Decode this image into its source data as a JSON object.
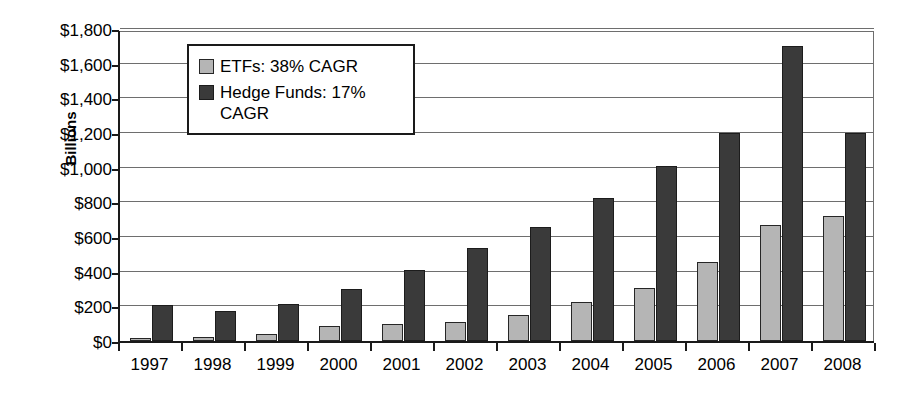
{
  "chart_data": {
    "type": "bar",
    "title": "",
    "xlabel": "",
    "ylabel": "Billions",
    "ylim": [
      0,
      1800
    ],
    "ytick_step": 200,
    "grid": true,
    "legend_position": "upper-left-inside",
    "categories": [
      "1997",
      "1998",
      "1999",
      "2000",
      "2001",
      "2002",
      "2003",
      "2004",
      "2005",
      "2006",
      "2007",
      "2008"
    ],
    "ytick_labels": [
      "$1,800",
      "$1,600",
      "$1,400",
      "$1,200",
      "$1,000",
      "$800",
      "$600",
      "$400",
      "$200",
      "$0"
    ],
    "ytick_values": [
      1800,
      1600,
      1400,
      1200,
      1000,
      800,
      600,
      400,
      200,
      0
    ],
    "series": [
      {
        "name": "ETFs: 38% CAGR",
        "short_name": "ETFs",
        "cagr": "38%",
        "color": "#b5b5b5",
        "values": [
          20,
          22,
          40,
          85,
          100,
          110,
          150,
          225,
          305,
          455,
          670,
          720
        ]
      },
      {
        "name": "Hedge Funds: 17% CAGR",
        "short_name": "Hedge Funds",
        "cagr": "17%",
        "color": "#3a3a3a",
        "values": [
          210,
          175,
          215,
          300,
          410,
          535,
          655,
          825,
          1010,
          1200,
          1700,
          1200
        ]
      }
    ]
  },
  "legend": {
    "entries": [
      {
        "label": "ETFs: 38% CAGR",
        "color": "#b5b5b5"
      },
      {
        "label": "Hedge Funds: 17% CAGR",
        "color": "#3a3a3a"
      }
    ]
  },
  "axis": {
    "y_title": "Billions"
  }
}
